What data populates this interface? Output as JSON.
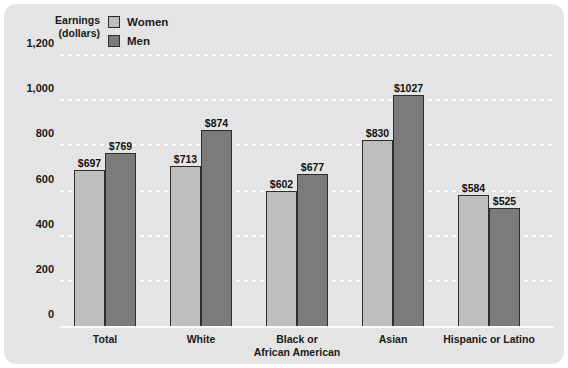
{
  "legend": {
    "items": [
      {
        "label": "Women",
        "color": "#bebebe",
        "key": "women"
      },
      {
        "label": "Men",
        "color": "#7b7b7b",
        "key": "men"
      }
    ]
  },
  "axis_title": {
    "line1": "Earnings",
    "line2": "(dollars)"
  },
  "chart_data": {
    "type": "bar",
    "title": "",
    "xlabel": "",
    "ylabel": "Earnings (dollars)",
    "ylim": [
      0,
      1200
    ],
    "yticks": [
      "0",
      "200",
      "400",
      "600",
      "800",
      "1,000",
      "1,200"
    ],
    "ytick_values": [
      0,
      200,
      400,
      600,
      800,
      1000,
      1200
    ],
    "grid": true,
    "legend_position": "top-left",
    "categories": [
      "Total",
      "White",
      "Black or African American",
      "Asian",
      "Hispanic or Latino"
    ],
    "category_lines": [
      [
        "Total"
      ],
      [
        "White"
      ],
      [
        "Black or",
        "African American"
      ],
      [
        "Asian"
      ],
      [
        "Hispanic or Latino"
      ]
    ],
    "series": [
      {
        "name": "Women",
        "color": "#bebebe",
        "values": [
          697,
          713,
          602,
          830,
          584
        ],
        "labels": [
          "$697",
          "$713",
          "$602",
          "$830",
          "$584"
        ]
      },
      {
        "name": "Men",
        "color": "#7b7b7b",
        "values": [
          769,
          874,
          677,
          1027,
          525
        ],
        "labels": [
          "$769",
          "$874",
          "$677",
          "$1027",
          "$525"
        ]
      }
    ]
  }
}
